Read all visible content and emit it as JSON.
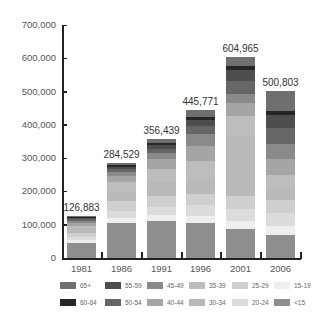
{
  "chart_data": {
    "type": "bar",
    "stacked": true,
    "title": "",
    "xlabel": "",
    "ylabel": "",
    "ylim": [
      0,
      700000
    ],
    "yticks": [
      "0",
      "100,000",
      "200,000",
      "300,000",
      "400,000",
      "500,000",
      "600,000",
      "700,000"
    ],
    "categories": [
      "1981",
      "1986",
      "1991",
      "1996",
      "2001",
      "2006"
    ],
    "totals": [
      126883,
      284529,
      356439,
      445771,
      604965,
      500803
    ],
    "total_labels": [
      "126,883",
      "284,529",
      "356,439",
      "445,771",
      "604,965",
      "500,803"
    ],
    "grid": false,
    "legend_position": "bottom",
    "series": [
      {
        "name": "<15",
        "color": "#8e8e8e",
        "values": [
          45000,
          105000,
          112000,
          105000,
          88000,
          70000
        ]
      },
      {
        "name": "15-19",
        "color": "#eeeeee",
        "values": [
          9000,
          15000,
          18000,
          22000,
          22000,
          25000
        ]
      },
      {
        "name": "20-24",
        "color": "#dcdcdc",
        "values": [
          10000,
          20000,
          22000,
          32000,
          36000,
          40000
        ]
      },
      {
        "name": "25-29",
        "color": "#cfcfcf",
        "values": [
          12000,
          30000,
          35000,
          33000,
          40000,
          38000
        ]
      },
      {
        "name": "30-34",
        "color": "#b9b9b9",
        "values": [
          11000,
          32000,
          40000,
          45000,
          180000,
          35000
        ]
      },
      {
        "name": "35-39",
        "color": "#bdbdbd",
        "values": [
          9000,
          26000,
          42000,
          55000,
          60000,
          40000
        ]
      },
      {
        "name": "40-44",
        "color": "#a5a5a5",
        "values": [
          8000,
          18000,
          28000,
          45000,
          40000,
          50000
        ]
      },
      {
        "name": "45-49",
        "color": "#8a8a8a",
        "values": [
          7000,
          12000,
          20000,
          35000,
          28000,
          45000
        ]
      },
      {
        "name": "50-54",
        "color": "#666666",
        "values": [
          5000,
          9000,
          12000,
          25000,
          38000,
          48000
        ]
      },
      {
        "name": "55-59",
        "color": "#4e4e4e",
        "values": [
          4500,
          7500,
          10000,
          18000,
          32000,
          40000
        ]
      },
      {
        "name": "60-64",
        "color": "#262626",
        "values": [
          3000,
          5500,
          8000,
          10000,
          12000,
          12000
        ]
      },
      {
        "name": "65+",
        "color": "#6f6f6f",
        "values": [
          3383,
          4529,
          9439,
          20771,
          28965,
          57803
        ]
      }
    ]
  },
  "legend": {
    "row1": [
      {
        "label": "65+",
        "color": "#6f6f6f"
      },
      {
        "label": "55-59",
        "color": "#4e4e4e"
      },
      {
        "label": "45-49",
        "color": "#8a8a8a"
      },
      {
        "label": "35-39",
        "color": "#bdbdbd"
      },
      {
        "label": "25-29",
        "color": "#cfcfcf"
      },
      {
        "label": "15-19",
        "color": "#eeeeee"
      }
    ],
    "row2": [
      {
        "label": "60-64",
        "color": "#262626"
      },
      {
        "label": "50-54",
        "color": "#666666"
      },
      {
        "label": "40-44",
        "color": "#a5a5a5"
      },
      {
        "label": "30-34",
        "color": "#b9b9b9"
      },
      {
        "label": "20-24",
        "color": "#dcdcdc"
      },
      {
        "label": "<15",
        "color": "#8e8e8e"
      }
    ]
  }
}
